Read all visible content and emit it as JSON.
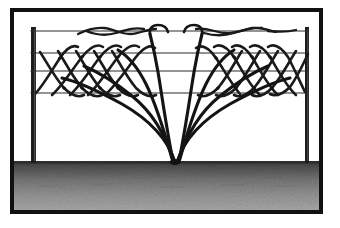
{
  "figure": {
    "caption": "Line illustration: a climbing plant rises from a single crown at ground level, its canes fanning out and weaving in a zigzag pattern between four horizontal fence wires strung between two posts; tendrils twine along the top wire."
  },
  "colors": {
    "frame": "#111111",
    "ink": "#1a1a1a",
    "wire": "#2b2b2b",
    "post": "#1c1c1c",
    "ground_top": "#3d3d3d",
    "ground_bottom": "#a8a8a8",
    "paper": "#ffffff"
  },
  "frame": {
    "x": 10,
    "y": 8,
    "width": 313,
    "height": 206,
    "stroke_width": 4
  },
  "ground": {
    "label": "soil",
    "top_y": 161,
    "bottom_y": 210,
    "left_x": 14,
    "right_x": 319
  },
  "posts": [
    {
      "label": "left-post",
      "x": 31,
      "top_y": 27,
      "bottom_y": 163,
      "width": 5
    },
    {
      "label": "right-post",
      "x": 305,
      "top_y": 27,
      "bottom_y": 163,
      "width": 4
    }
  ],
  "wires": [
    {
      "label": "wire-1-top",
      "y": 31,
      "x1": 31,
      "x2": 308,
      "stroke_width": 1.1
    },
    {
      "label": "wire-2",
      "y": 53,
      "x1": 31,
      "x2": 308,
      "stroke_width": 1.1
    },
    {
      "label": "wire-3",
      "y": 71,
      "x1": 31,
      "x2": 308,
      "stroke_width": 1.1
    },
    {
      "label": "wire-4-bottom",
      "y": 93,
      "x1": 31,
      "x2": 308,
      "stroke_width": 1.1
    }
  ],
  "crown": {
    "label": "plant-crown",
    "x": 175,
    "y": 162
  },
  "canes": [
    {
      "label": "cane-left-1",
      "d": "M175,162 C168,140 150,120 122,104 C100,92 80,82 62,78"
    },
    {
      "label": "cane-left-2",
      "d": "M174,162 C166,136 152,112 132,96 C116,83 98,72 84,66"
    },
    {
      "label": "cane-left-3",
      "d": "M173,162 C164,130 156,104 146,84 C138,68 128,56 118,50"
    },
    {
      "label": "cane-left-4",
      "d": "M173,161 C166,126 162,96 158,72 C155,54 152,42 150,34"
    },
    {
      "label": "cane-right-1",
      "d": "M177,162 C184,140 202,120 230,104 C252,92 272,82 290,78"
    },
    {
      "label": "cane-right-2",
      "d": "M178,162 C186,136 200,112 220,96 C236,83 254,72 268,66"
    },
    {
      "label": "cane-right-3",
      "d": "M179,162 C188,130 196,104 206,84 C214,68 224,56 234,50"
    },
    {
      "label": "cane-right-4",
      "d": "M179,161 C186,126 190,96 194,72 C197,54 200,42 202,34"
    }
  ],
  "zigzag_left": {
    "label": "woven-shoots-left",
    "paths": [
      "M36,93 C44,84 52,70 60,58 C66,49 72,44 78,47",
      "M52,95 C62,86 72,70 82,57 C90,47 97,43 103,47",
      "M70,95 C80,86 90,70 100,57 C108,47 115,43 121,47",
      "M88,95 C98,86 108,70 118,57 C126,47 133,43 139,47",
      "M106,94 C116,85 126,70 136,57 C143,48 150,44 155,48",
      "M40,52 C46,61 54,76 64,88 C71,95 78,98 84,95",
      "M58,51 C64,60 72,76 82,88 C89,95 96,98 102,95",
      "M76,51 C82,60 90,76 100,88 C107,95 114,98 120,95",
      "M94,51 C100,60 108,76 118,88 C125,95 132,98 138,95",
      "M112,51 C118,60 126,76 136,88 C143,95 150,98 156,95"
    ]
  },
  "zigzag_right": {
    "label": "woven-shoots-right",
    "paths": [
      "M196,48 C202,44 209,48 216,58 C224,70 232,85 240,94",
      "M214,47 C220,43 227,47 234,57 C242,70 250,86 260,95",
      "M232,47 C238,43 245,47 252,57 C260,70 268,86 278,95",
      "M250,47 C256,43 263,47 270,57 C278,70 286,86 296,95",
      "M268,47 C274,43 281,47 288,57 C294,68 300,82 305,92",
      "M198,95 C204,98 211,95 218,88 C228,76 236,60 242,51",
      "M216,95 C222,98 229,95 236,88 C246,76 254,60 260,51",
      "M234,95 C240,98 247,95 254,88 C264,76 272,60 278,51",
      "M252,95 C258,98 265,95 272,88 C282,76 290,60 296,51",
      "M270,94 C276,97 283,94 290,87 C298,76 304,62 308,54"
    ]
  },
  "tendrils_top": {
    "label": "tendrils-on-top-wire",
    "paths": [
      "M78,34 C86,30 94,27 104,28 C114,29 120,34 130,34 C140,34 146,29 156,29",
      "M86,31 C96,35 106,36 116,33 C126,30 134,27 144,29",
      "M196,29 C206,27 214,32 224,33 C234,34 242,30 252,28 C262,27 268,30 276,32",
      "M204,33 C214,36 224,36 234,33 C244,30 252,27 262,28",
      "M268,31 C278,32 288,32 296,30"
    ]
  },
  "ground_speckle_seed": 7
}
